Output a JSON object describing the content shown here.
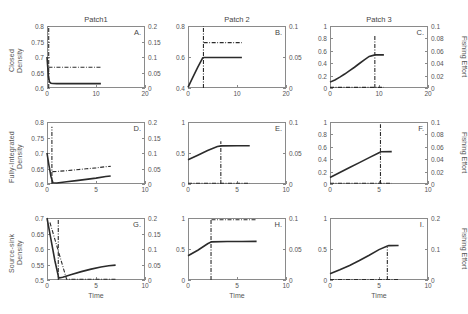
{
  "figure": {
    "column_titles": [
      "Patch1",
      "Patch 2",
      "Patch 3"
    ],
    "row_labels": [
      "Closed\nDensity",
      "Fully-Integrated\nDensity",
      "Source-sink\nDensity"
    ],
    "right_axis_label": "Fishing Effort",
    "x_axis_label": "Time",
    "panel_letters": [
      "A.",
      "B.",
      "C.",
      "D.",
      "E.",
      "F.",
      "G.",
      "H.",
      "I."
    ],
    "colors": {
      "line": "#2b2b2b",
      "axis": "#8a8a8a",
      "text": "#555555"
    }
  },
  "chart_data": [
    {
      "id": "A",
      "type": "line",
      "title": "Patch1",
      "row": "Closed Density",
      "xlabel": "",
      "ylabel": "Closed Density",
      "y2label": "Fishing Effort",
      "xlim": [
        0,
        20
      ],
      "ylim": [
        0.6,
        0.8
      ],
      "y2lim": [
        0,
        0.2
      ],
      "grid": false,
      "xticks": [
        0,
        10,
        20
      ],
      "yticks": [
        0.6,
        0.65,
        0.7,
        0.75,
        0.8
      ],
      "y2ticks": [
        0,
        0.05,
        0.1,
        0.15,
        0.2
      ],
      "series": [
        {
          "name": "density",
          "style": "solid",
          "axis": "left",
          "x": [
            0,
            0.15,
            0.3,
            0.5,
            0.8,
            1.2,
            2,
            4,
            7,
            11
          ],
          "y": [
            0.7,
            0.668,
            0.636,
            0.62,
            0.6155,
            0.6145,
            0.614,
            0.614,
            0.614,
            0.614
          ]
        },
        {
          "name": "effort-equilibrium",
          "style": "dashdot",
          "axis": "left",
          "x": [
            0.3,
            2,
            5,
            8,
            11
          ],
          "y": [
            0.667,
            0.667,
            0.667,
            0.667,
            0.667
          ]
        },
        {
          "name": "switch-time-marker",
          "style": "dashdot-vertical",
          "axis": "left",
          "x": [
            0.35,
            0.35
          ],
          "y": [
            0.6,
            0.8
          ]
        }
      ]
    },
    {
      "id": "B",
      "type": "line",
      "title": "Patch 2",
      "row": "Closed Density",
      "xlabel": "",
      "ylabel": "",
      "y2label": "Fishing Effort",
      "xlim": [
        0,
        20
      ],
      "ylim": [
        0.4,
        0.8
      ],
      "y2lim": [
        0,
        0.1
      ],
      "grid": false,
      "xticks": [
        0,
        10,
        20
      ],
      "yticks": [
        0.4,
        0.6,
        0.8
      ],
      "y2ticks": [
        0,
        0.05,
        0.1
      ],
      "series": [
        {
          "name": "density",
          "style": "solid",
          "axis": "left",
          "x": [
            0,
            1,
            2,
            3,
            3.2,
            6,
            11
          ],
          "y": [
            0.404,
            0.47,
            0.535,
            0.594,
            0.597,
            0.597,
            0.597
          ]
        },
        {
          "name": "effort-equilibrium",
          "style": "dashdot",
          "axis": "left",
          "x": [
            3.2,
            6,
            9,
            11
          ],
          "y": [
            0.693,
            0.693,
            0.693,
            0.693
          ]
        },
        {
          "name": "switch-time-marker",
          "style": "dashdot-vertical",
          "axis": "left",
          "x": [
            3.15,
            3.15
          ],
          "y": [
            0.4,
            0.8
          ]
        }
      ]
    },
    {
      "id": "C",
      "type": "line",
      "title": "Patch 3",
      "row": "Closed Density",
      "xlabel": "",
      "ylabel": "",
      "y2label": "Fishing Effort",
      "xlim": [
        0,
        20
      ],
      "ylim": [
        0,
        1
      ],
      "y2lim": [
        0,
        0.1
      ],
      "grid": false,
      "xticks": [
        0,
        10,
        20
      ],
      "yticks": [
        0,
        0.2,
        0.4,
        0.6,
        0.8,
        1
      ],
      "y2ticks": [
        0,
        0.02,
        0.04,
        0.06,
        0.08,
        0.1
      ],
      "series": [
        {
          "name": "density",
          "style": "solid",
          "axis": "left",
          "x": [
            0,
            1,
            2,
            3,
            4,
            5,
            6,
            7,
            8,
            9,
            9.2,
            11
          ],
          "y": [
            0.095,
            0.13,
            0.175,
            0.225,
            0.28,
            0.335,
            0.395,
            0.455,
            0.51,
            0.53,
            0.535,
            0.535
          ]
        },
        {
          "name": "effort-equilibrium",
          "style": "dashdot",
          "axis": "left",
          "x": [
            0,
            4,
            8,
            11
          ],
          "y": [
            0.01,
            0.01,
            0.01,
            0.01
          ]
        },
        {
          "name": "switch-time-marker",
          "style": "dashdot-vertical",
          "axis": "left",
          "x": [
            9.15,
            9.15
          ],
          "y": [
            0,
            0.84
          ]
        }
      ]
    },
    {
      "id": "D",
      "type": "line",
      "title": "",
      "row": "Fully-Integrated Density",
      "xlabel": "",
      "ylabel": "Fully-Integrated Density",
      "y2label": "Fishing Effort",
      "xlim": [
        0,
        10
      ],
      "ylim": [
        0.6,
        0.8
      ],
      "y2lim": [
        0,
        0.2
      ],
      "grid": false,
      "xticks": [
        0,
        5,
        10
      ],
      "yticks": [
        0.6,
        0.65,
        0.7,
        0.75,
        0.8
      ],
      "y2ticks": [
        0,
        0.05,
        0.1,
        0.15,
        0.2
      ],
      "series": [
        {
          "name": "density",
          "style": "solid",
          "axis": "left",
          "x": [
            0,
            0.2,
            0.4,
            0.6,
            1,
            2,
            3,
            4,
            5,
            6,
            6.5
          ],
          "y": [
            0.7,
            0.66,
            0.625,
            0.604,
            0.603,
            0.607,
            0.611,
            0.615,
            0.619,
            0.624,
            0.626
          ]
        },
        {
          "name": "effort-equilibrium",
          "style": "dashdot",
          "axis": "left",
          "x": [
            0.55,
            1,
            2,
            3,
            4,
            5,
            6,
            6.5
          ],
          "y": [
            0.64,
            0.6405,
            0.643,
            0.646,
            0.649,
            0.652,
            0.656,
            0.657
          ]
        },
        {
          "name": "switch-time-marker",
          "style": "dashdot-vertical",
          "axis": "left",
          "x": [
            0.5,
            0.5
          ],
          "y": [
            0.6,
            0.785
          ]
        }
      ]
    },
    {
      "id": "E",
      "type": "line",
      "title": "",
      "row": "Fully-Integrated Density",
      "xlabel": "",
      "ylabel": "",
      "y2label": "Fishing Effort",
      "xlim": [
        0,
        10
      ],
      "ylim": [
        0,
        1
      ],
      "y2lim": [
        0,
        0.1
      ],
      "grid": false,
      "xticks": [
        0,
        5,
        10
      ],
      "yticks": [
        0,
        0.5,
        1
      ],
      "y2ticks": [
        0,
        0.05,
        0.1
      ],
      "series": [
        {
          "name": "density",
          "style": "solid",
          "axis": "left",
          "x": [
            0,
            1,
            2,
            3,
            3.4,
            5,
            6.3
          ],
          "y": [
            0.39,
            0.465,
            0.54,
            0.605,
            0.615,
            0.617,
            0.618
          ]
        },
        {
          "name": "effort-equilibrium",
          "style": "dashdot",
          "axis": "left",
          "x": [
            0,
            2,
            4,
            6.3
          ],
          "y": [
            0.012,
            0.012,
            0.012,
            0.012
          ]
        },
        {
          "name": "switch-time-marker",
          "style": "dashdot-vertical",
          "axis": "left",
          "x": [
            3.35,
            3.35
          ],
          "y": [
            0,
            0.69
          ]
        }
      ]
    },
    {
      "id": "F",
      "type": "line",
      "title": "",
      "row": "Fully-Integrated Density",
      "xlabel": "",
      "ylabel": "",
      "y2label": "Fishing Effort",
      "xlim": [
        0,
        10
      ],
      "ylim": [
        0,
        1
      ],
      "y2lim": [
        0,
        0.1
      ],
      "grid": false,
      "xticks": [
        0,
        5,
        10
      ],
      "yticks": [
        0,
        0.2,
        0.4,
        0.6,
        0.8,
        1
      ],
      "y2ticks": [
        0,
        0.02,
        0.04,
        0.06,
        0.08,
        0.1
      ],
      "series": [
        {
          "name": "density",
          "style": "solid",
          "axis": "left",
          "x": [
            0,
            1,
            2,
            3,
            4,
            5,
            5.2,
            6.3
          ],
          "y": [
            0.105,
            0.185,
            0.265,
            0.345,
            0.425,
            0.505,
            0.52,
            0.522
          ]
        },
        {
          "name": "effort-equilibrium",
          "style": "dashdot",
          "axis": "left",
          "x": [
            0,
            2,
            4,
            6.3
          ],
          "y": [
            0.012,
            0.012,
            0.012,
            0.012
          ]
        },
        {
          "name": "switch-time-marker",
          "style": "dashdot-vertical",
          "axis": "left",
          "x": [
            5.15,
            5.15
          ],
          "y": [
            0,
            0.965
          ]
        }
      ]
    },
    {
      "id": "G",
      "type": "line",
      "title": "",
      "row": "Source-sink Density",
      "xlabel": "Time",
      "ylabel": "Source-sink Density",
      "y2label": "Fishing Effort",
      "xlim": [
        0,
        10
      ],
      "ylim": [
        0.5,
        0.7
      ],
      "y2lim": [
        0,
        0.2
      ],
      "grid": false,
      "xticks": [
        0,
        5,
        10
      ],
      "yticks": [
        0.5,
        0.55,
        0.6,
        0.65,
        0.7
      ],
      "y2ticks": [
        0,
        0.05,
        0.1,
        0.15,
        0.2
      ],
      "series": [
        {
          "name": "density",
          "style": "solid",
          "axis": "left",
          "x": [
            0,
            0.4,
            0.8,
            1.2,
            1.6,
            2.5,
            3.5,
            4.5,
            5.5,
            6.3,
            7
          ],
          "y": [
            0.7,
            0.632,
            0.563,
            0.506,
            0.509,
            0.518,
            0.527,
            0.535,
            0.542,
            0.546,
            0.548
          ]
        },
        {
          "name": "effort-equilibrium",
          "style": "dashdot",
          "axis": "left",
          "x": [
            0.3,
            2,
            4,
            6,
            7
          ],
          "y": [
            0.6855,
            0.5025,
            0.5025,
            0.5025,
            0.5025
          ]
        },
        {
          "name": "switch-time-marker",
          "style": "dashdot-vertical",
          "axis": "left",
          "x": [
            1.15,
            1.15
          ],
          "y": [
            0.5,
            0.697
          ]
        }
      ]
    },
    {
      "id": "H",
      "type": "line",
      "title": "",
      "row": "Source-sink Density",
      "xlabel": "Time",
      "ylabel": "",
      "y2label": "Fishing Effort",
      "xlim": [
        0,
        10
      ],
      "ylim": [
        0,
        1
      ],
      "y2lim": [
        0,
        0.1
      ],
      "grid": false,
      "xticks": [
        0,
        5,
        10
      ],
      "yticks": [
        0,
        0.5,
        1
      ],
      "y2ticks": [
        0,
        0.05,
        0.1
      ],
      "series": [
        {
          "name": "density",
          "style": "solid",
          "axis": "left",
          "x": [
            0,
            1,
            2,
            2.4,
            4,
            5.5,
            7
          ],
          "y": [
            0.39,
            0.48,
            0.585,
            0.615,
            0.62,
            0.622,
            0.623
          ]
        },
        {
          "name": "effort-equilibrium",
          "style": "dashdot",
          "axis": "left",
          "x": [
            2.4,
            4,
            6,
            7
          ],
          "y": [
            0.972,
            0.972,
            0.972,
            0.972
          ]
        },
        {
          "name": "switch-time-marker",
          "style": "dashdot-vertical",
          "axis": "left",
          "x": [
            2.35,
            2.35
          ],
          "y": [
            0,
            0.97
          ]
        }
      ]
    },
    {
      "id": "I",
      "type": "line",
      "title": "",
      "row": "Source-sink Density",
      "xlabel": "Time",
      "ylabel": "",
      "y2label": "Fishing Effort",
      "xlim": [
        0,
        10
      ],
      "ylim": [
        0,
        1
      ],
      "y2lim": [
        0,
        0.2
      ],
      "grid": false,
      "xticks": [
        0,
        5,
        10
      ],
      "yticks": [
        0,
        0.5,
        1
      ],
      "y2ticks": [
        0,
        0.1,
        0.2
      ],
      "series": [
        {
          "name": "density",
          "style": "solid",
          "axis": "left",
          "x": [
            0,
            1,
            2,
            3,
            4,
            5,
            5.8,
            6,
            7
          ],
          "y": [
            0.1,
            0.165,
            0.235,
            0.315,
            0.4,
            0.49,
            0.545,
            0.555,
            0.557
          ]
        },
        {
          "name": "effort-equilibrium",
          "style": "dashdot",
          "axis": "left",
          "x": [
            0,
            3,
            5,
            7
          ],
          "y": [
            0.008,
            0.008,
            0.008,
            0.008
          ]
        },
        {
          "name": "switch-time-marker",
          "style": "dashdot-vertical",
          "axis": "left",
          "x": [
            5.85,
            5.85
          ],
          "y": [
            0,
            0.53
          ]
        }
      ]
    }
  ]
}
